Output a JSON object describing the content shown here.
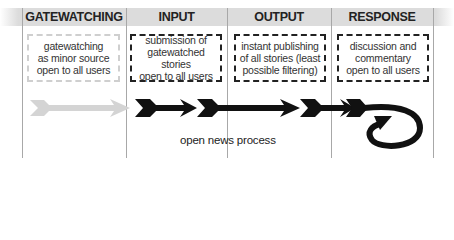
{
  "columns": [
    {
      "header": "GATEWATCHING",
      "box_text": "gatewatching\nas minor source\nopen to all users",
      "style": "light"
    },
    {
      "header": "INPUT",
      "box_text": "submission of\ngatewatched stories\nopen to all users",
      "style": "dark"
    },
    {
      "header": "OUTPUT",
      "box_text": "instant publishing\nof all stories (least\npossible filtering)",
      "style": "dark"
    },
    {
      "header": "RESPONSE",
      "box_text": "discussion and\ncommentary\nopen to all users",
      "style": "dark"
    }
  ],
  "flow_label": "open news process",
  "colors": {
    "active_arrow": "#111111",
    "inactive_arrow": "#d4d4d4",
    "header_band": "#dcdcdc"
  }
}
